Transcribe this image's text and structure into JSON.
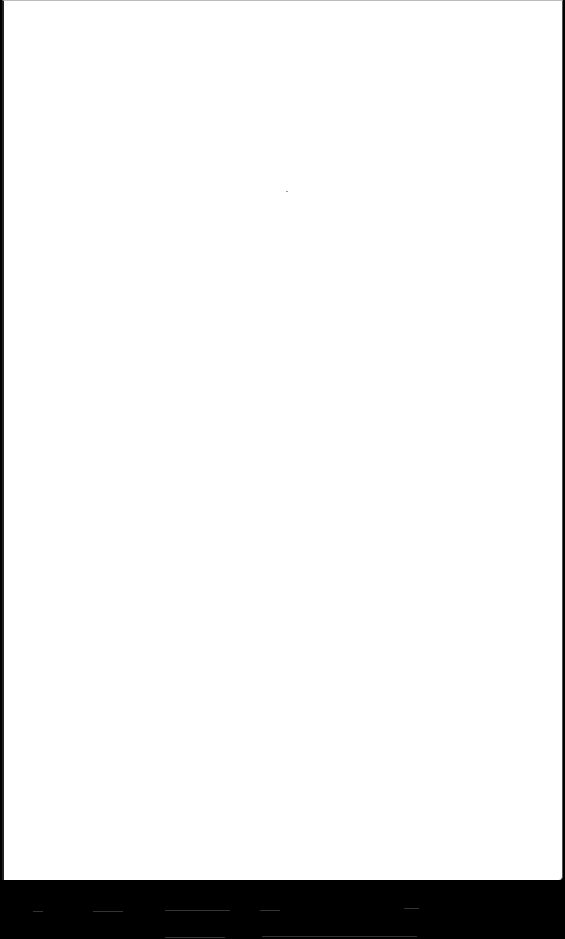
{
  "document": {
    "type": "scanned page",
    "content": "",
    "background_color": "#000000",
    "page_color": "#ffffff"
  }
}
